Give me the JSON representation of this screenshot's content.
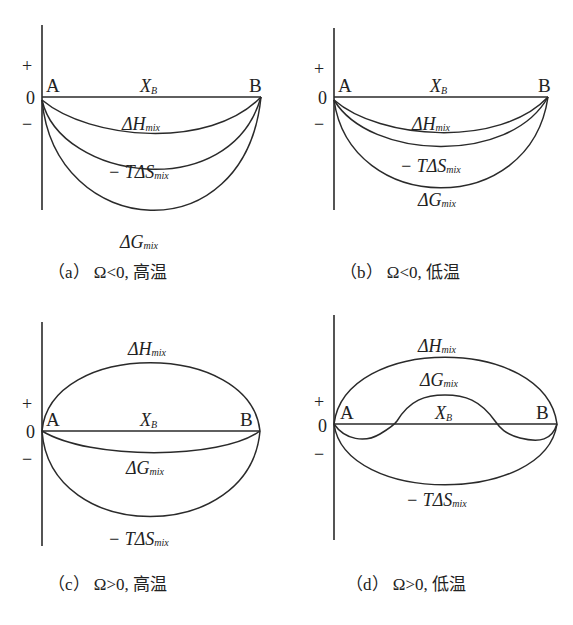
{
  "axis_labels": {
    "plus": "+",
    "zero": "0",
    "minus": "−",
    "a": "A",
    "b": "B",
    "x": "X",
    "x_sub": "B"
  },
  "terms": {
    "dH": {
      "prefix": "ΔH",
      "sub": "mix"
    },
    "TdS": {
      "prefix": "− TΔS",
      "sub": "mix"
    },
    "dG": {
      "prefix": "ΔG",
      "sub": "mix"
    }
  },
  "panels": [
    {
      "id": "a",
      "caption": "（a） Ω<0, 高温"
    },
    {
      "id": "b",
      "caption": "（b） Ω<0, 低温"
    },
    {
      "id": "c",
      "caption": "（c） Ω>0, 高温"
    },
    {
      "id": "d",
      "caption": "（d） Ω>0, 低温"
    }
  ],
  "colors": {
    "line": "#2a2a2a",
    "text": "#222222",
    "background": "#ffffff"
  }
}
